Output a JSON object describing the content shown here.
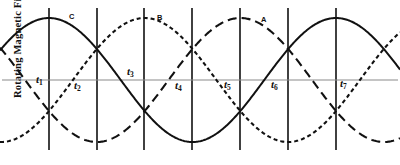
{
  "figure": {
    "y_axis_label": "Rotating Magnetic Field",
    "background": "#ffffff",
    "axis_color": "#8a8a8a",
    "curve_color": "#111111",
    "gridline_color": "#111111"
  },
  "time_marks": [
    {
      "id": "t1",
      "base": "t",
      "sub": "1",
      "x": 49,
      "label_x": 36,
      "label_y": 74
    },
    {
      "id": "t2",
      "base": "t",
      "sub": "2",
      "x": 97,
      "label_x": 74,
      "label_y": 80
    },
    {
      "id": "t3",
      "base": "t",
      "sub": "3",
      "x": 144,
      "label_x": 127,
      "label_y": 66
    },
    {
      "id": "t4",
      "base": "t",
      "sub": "4",
      "x": 192,
      "label_x": 175,
      "label_y": 80
    },
    {
      "id": "t5",
      "base": "t",
      "sub": "5",
      "x": 240,
      "label_x": 224,
      "label_y": 79
    },
    {
      "id": "t6",
      "base": "t",
      "sub": "6",
      "x": 288,
      "label_x": 271,
      "label_y": 79
    },
    {
      "id": "t7",
      "base": "t",
      "sub": "7",
      "x": 336,
      "label_x": 340,
      "label_y": 78
    }
  ],
  "curve_labels": [
    {
      "id": "C",
      "text": "C",
      "x": 69,
      "y": 13
    },
    {
      "id": "B",
      "text": "B",
      "x": 157,
      "y": 14
    },
    {
      "id": "A",
      "text": "A",
      "x": 261,
      "y": 16
    }
  ],
  "chart_data": {
    "type": "line",
    "title": "",
    "xlabel": "",
    "ylabel": "Rotating Magnetic Field",
    "grid": true,
    "legend": "inline-curve-labels",
    "x_axis": {
      "tick_labels": [
        "t1",
        "t2",
        "t3",
        "t4",
        "t5",
        "t6",
        "t7"
      ],
      "tick_x_px": [
        49,
        97,
        144,
        192,
        240,
        288,
        336
      ],
      "interval_degrees": 60,
      "period_degrees": 360,
      "range_px": [
        49,
        336
      ]
    },
    "y_axis": {
      "zero_line_px": 80,
      "amplitude_px": 62,
      "ylim": [
        -1,
        1
      ],
      "tick_labels": []
    },
    "series": [
      {
        "name": "C",
        "style": "solid",
        "phase_degrees": 0,
        "amplitude": 1,
        "formula": "cos(theta)",
        "values_at_ticks": [
          1.0,
          0.5,
          -0.5,
          -1.0,
          -0.5,
          0.5,
          1.0
        ]
      },
      {
        "name": "B",
        "style": "short-dashed",
        "phase_degrees": 120,
        "amplitude": 1,
        "formula": "cos(theta - 120)",
        "values_at_ticks": [
          -0.5,
          0.5,
          1.0,
          0.5,
          -0.5,
          -1.0,
          -0.5
        ]
      },
      {
        "name": "A",
        "style": "long-dashed",
        "phase_degrees": 240,
        "amplitude": 1,
        "formula": "cos(theta - 240)",
        "values_at_ticks": [
          -0.5,
          -1.0,
          -0.5,
          0.5,
          1.0,
          0.5,
          -0.5
        ]
      }
    ]
  }
}
